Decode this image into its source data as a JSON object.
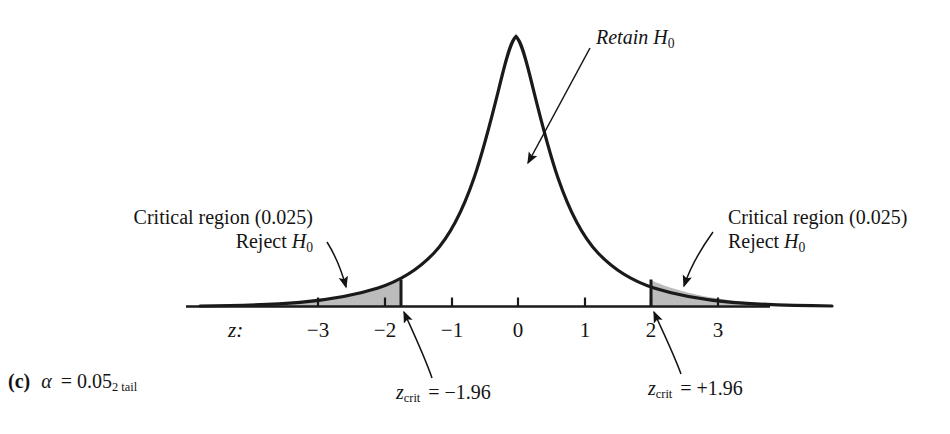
{
  "figure": {
    "caption_prefix": "(c)",
    "caption_alpha": "α",
    "caption_eq": "= 0.05",
    "caption_sub": "2 tail",
    "retain_label": "Retain H",
    "retain_sub": "0",
    "left_region_label": "Critical region (0.025)",
    "left_reject_label": "Reject H",
    "left_reject_sub": "0",
    "right_region_label": "Critical region (0.025)",
    "right_reject_label": "Reject H",
    "right_reject_sub": "0",
    "left_zcrit_name": "z",
    "left_zcrit_sub": "crit",
    "left_zcrit_value": "= −1.96",
    "right_zcrit_name": "z",
    "right_zcrit_sub": "crit",
    "right_zcrit_value": "= +1.96",
    "axis_name": "z:",
    "curve_color": "#1a1a1a",
    "shade_color": "#b8b8b8",
    "axis_color": "#1a1a1a"
  },
  "chart_data": {
    "type": "line",
    "title": "",
    "subtitle": "",
    "xlabel": "z",
    "ylabel": "",
    "distribution": "standard normal",
    "mean": 0,
    "sd": 1,
    "xlim": [
      -3.9,
      3.9
    ],
    "ylim": [
      0,
      0.4
    ],
    "grid": false,
    "legend_position": "none",
    "tick_labels": [
      "−3",
      "−2",
      "−1",
      "0",
      "1",
      "2",
      "3"
    ],
    "tick_values": [
      -3,
      -2,
      -1,
      0,
      1,
      2,
      3
    ],
    "critical_values": [
      -1.96,
      1.96
    ],
    "alpha": 0.05,
    "tail_area_each": 0.025,
    "tails": "two",
    "shaded_regions": [
      {
        "name": "left-critical-region",
        "from": -3.9,
        "to": -1.96,
        "area": 0.025
      },
      {
        "name": "right-critical-region",
        "from": 1.96,
        "to": 3.9,
        "area": 0.025
      }
    ],
    "annotations": [
      {
        "name": "retain-region",
        "text": "Retain H0",
        "points_to": [
          0.7,
          0.17
        ]
      },
      {
        "name": "left-critical",
        "text": "Critical region (0.025) Reject H0",
        "points_to": [
          -2.2,
          0.03
        ]
      },
      {
        "name": "right-critical",
        "text": "Critical region (0.025) Reject H0",
        "points_to": [
          2.25,
          0.03
        ]
      },
      {
        "name": "left-zcrit",
        "text": "zcrit = -1.96",
        "points_to": [
          -1.96,
          0.0
        ]
      },
      {
        "name": "right-zcrit",
        "text": "zcrit = +1.96",
        "points_to": [
          1.96,
          0.0
        ]
      }
    ],
    "series": [
      {
        "name": "standard normal density",
        "x": [
          -3.9,
          -3.5,
          -3.0,
          -2.5,
          -1.96,
          -1.5,
          -1.0,
          -0.5,
          0.0,
          0.5,
          1.0,
          1.5,
          1.96,
          2.5,
          3.0,
          3.5,
          3.9
        ],
        "values": [
          0.0002,
          0.0009,
          0.0044,
          0.0175,
          0.0584,
          0.1295,
          0.242,
          0.3521,
          0.3989,
          0.3521,
          0.242,
          0.1295,
          0.0584,
          0.0175,
          0.0044,
          0.0009,
          0.0002
        ]
      }
    ]
  }
}
